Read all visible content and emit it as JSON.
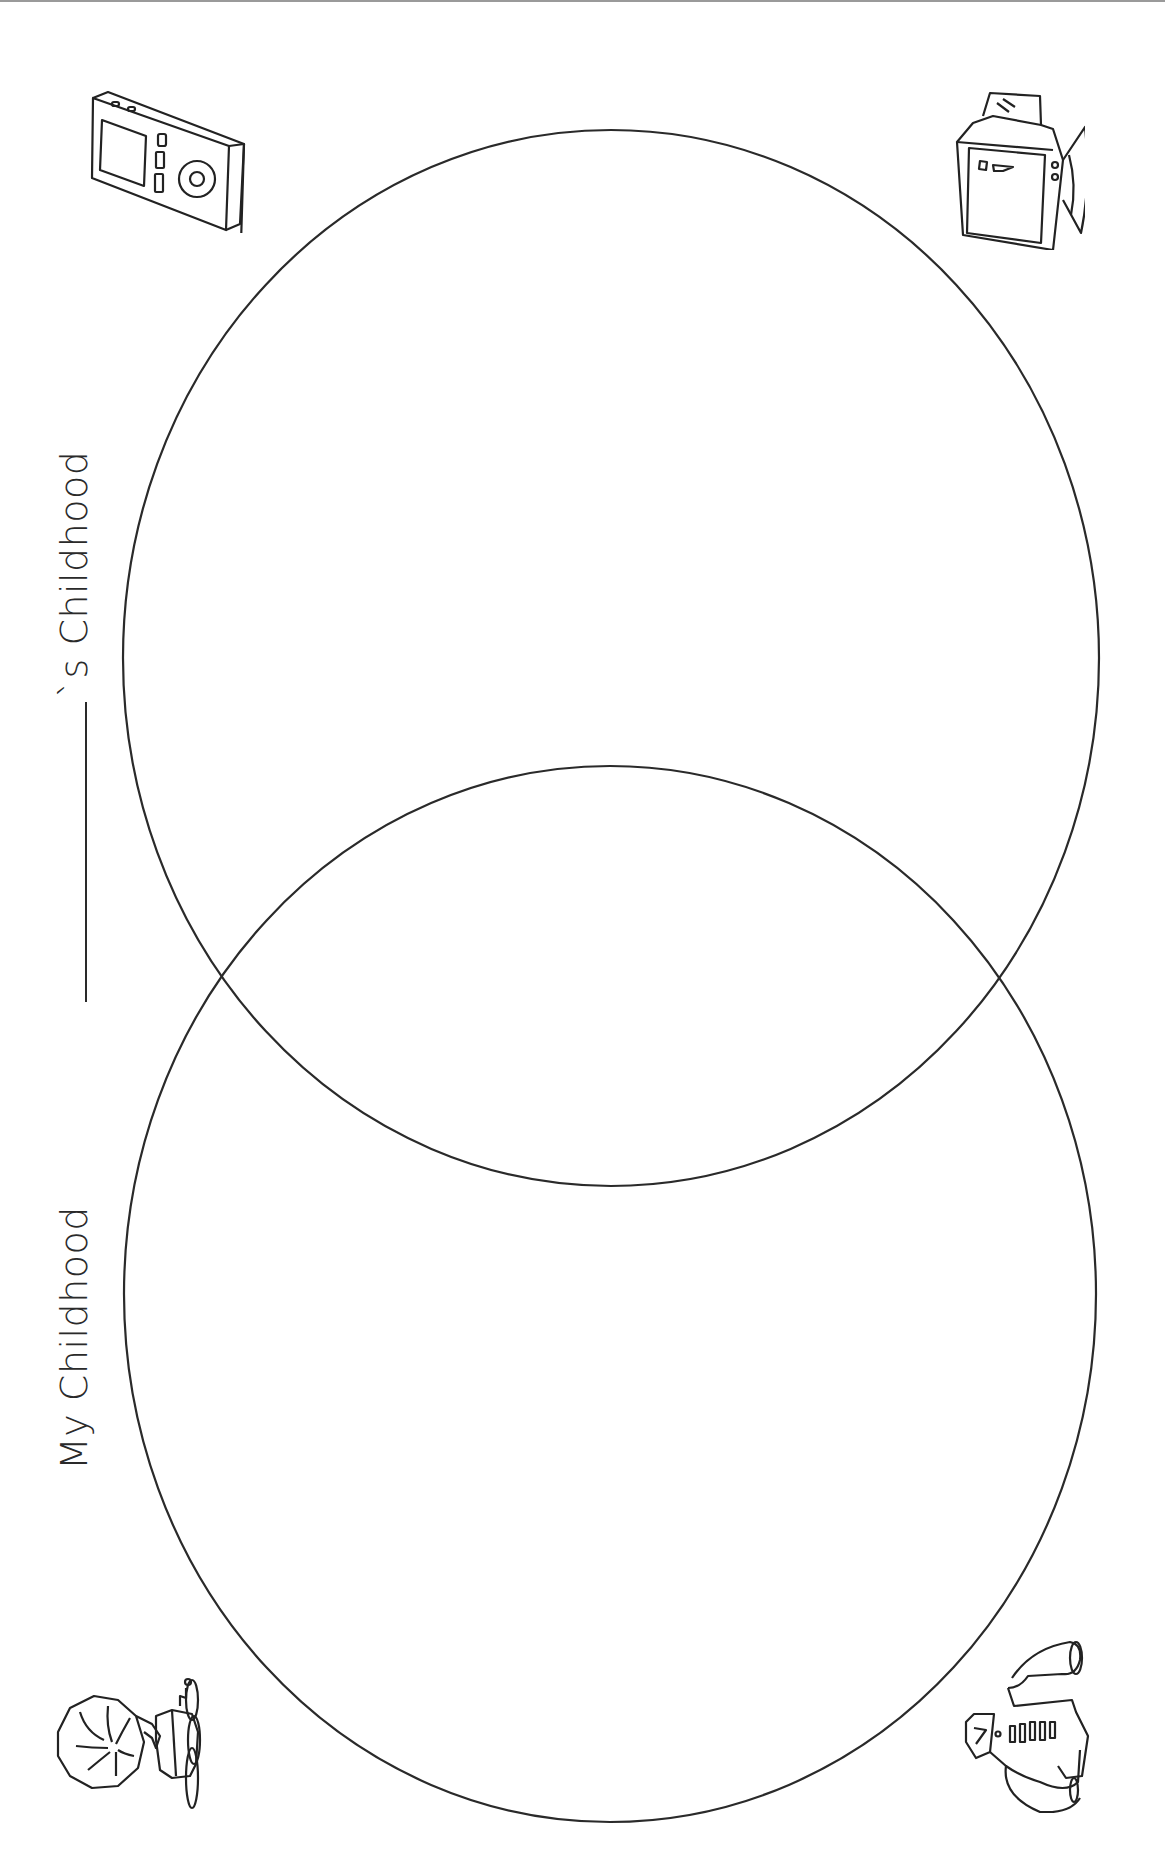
{
  "worksheet": {
    "labels": {
      "left_circle": "My Childhood",
      "right_circle_suffix": "`s Childhood",
      "right_circle_blank": ""
    },
    "icons": [
      {
        "name": "mp3-player-icon",
        "position": "top-left"
      },
      {
        "name": "camcorder-icon",
        "position": "top-right"
      },
      {
        "name": "gramophone-icon",
        "position": "bottom-left"
      },
      {
        "name": "shirt-icon",
        "position": "bottom-right"
      }
    ],
    "colors": {
      "line": "#2a2a2a",
      "background": "#ffffff"
    }
  }
}
